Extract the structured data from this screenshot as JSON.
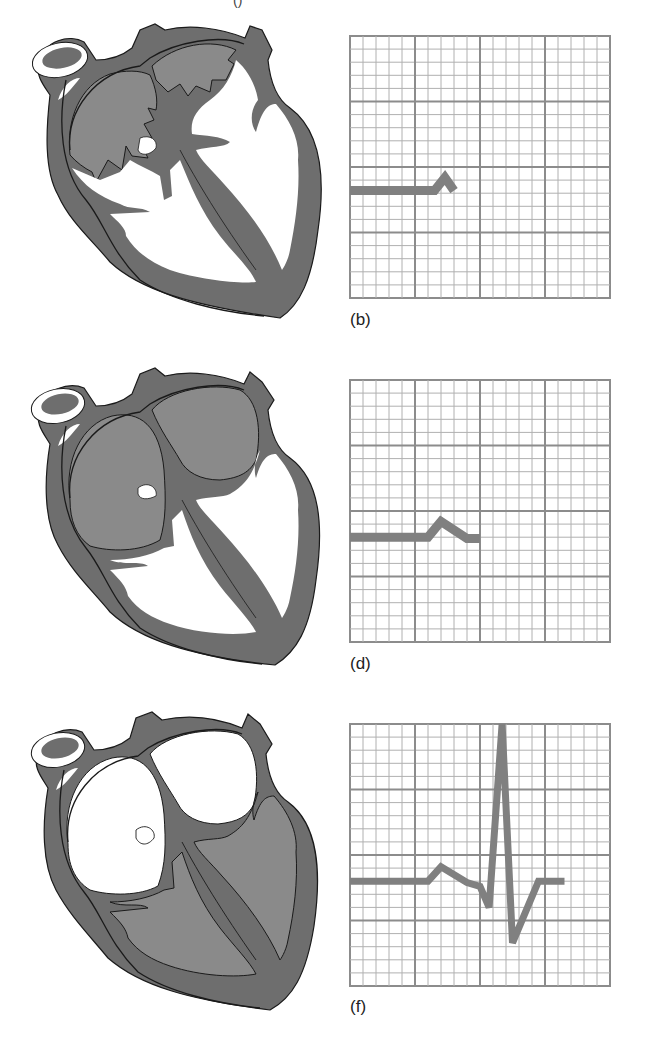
{
  "figure": {
    "top_fragment": "()",
    "colors": {
      "myocardium": "#6e6e6e",
      "blood_filled": "#8a8a8a",
      "outline": "#1a1a1a",
      "grid_minor": "#a8a8a8",
      "grid_major": "#8c8c8c",
      "trace": "#808080",
      "background": "#ffffff"
    },
    "panels": [
      {
        "id": "b",
        "label": "(b)",
        "heart": {
          "atria_filled": true,
          "atria_contracting": true,
          "ventricles_filled": false
        },
        "ecg_phase": "P wave (atrial depolarization)"
      },
      {
        "id": "d",
        "label": "(d)",
        "heart": {
          "atria_filled": true,
          "atria_contracting": false,
          "ventricles_filled": false
        },
        "ecg_phase": "P wave complete, PR segment"
      },
      {
        "id": "f",
        "label": "(f)",
        "heart": {
          "atria_filled": false,
          "atria_contracting": false,
          "ventricles_filled": true
        },
        "ecg_phase": "QRS complex (ventricular depolarization)"
      }
    ]
  },
  "chart_data": [
    {
      "type": "line",
      "title": "(b)",
      "grid": {
        "on": true,
        "minor_divisions": 20,
        "major_divisions": 4
      },
      "xlim": [
        0,
        20
      ],
      "ylim": [
        0,
        20
      ],
      "x": [
        0,
        6.5,
        7.3,
        8.0
      ],
      "y": [
        8.2,
        8.2,
        9.2,
        8.2
      ],
      "xlabel": "",
      "ylabel": ""
    },
    {
      "type": "line",
      "title": "(d)",
      "grid": {
        "on": true,
        "minor_divisions": 20,
        "major_divisions": 4
      },
      "xlim": [
        0,
        20
      ],
      "ylim": [
        0,
        20
      ],
      "x": [
        0,
        6.0,
        7.0,
        9.0,
        10.0
      ],
      "y": [
        8.0,
        8.0,
        9.2,
        7.9,
        7.9
      ],
      "xlabel": "",
      "ylabel": ""
    },
    {
      "type": "line",
      "title": "(f)",
      "grid": {
        "on": true,
        "minor_divisions": 20,
        "major_divisions": 4
      },
      "xlim": [
        0,
        20
      ],
      "ylim": [
        0,
        20
      ],
      "x": [
        0,
        6.0,
        7.0,
        9.0,
        10.0,
        10.7,
        11.7,
        12.5,
        14.5,
        16.5
      ],
      "y": [
        8.0,
        8.0,
        9.1,
        7.9,
        7.6,
        6.0,
        20.0,
        3.3,
        8.0,
        8.0
      ],
      "xlabel": "",
      "ylabel": ""
    }
  ]
}
